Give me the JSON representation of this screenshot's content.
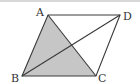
{
  "figure": {
    "type": "parallelogram",
    "vertices": {
      "A": {
        "label": "A",
        "x": 48,
        "y": 15
      },
      "B": {
        "label": "B",
        "x": 22,
        "y": 76
      },
      "C": {
        "label": "C",
        "x": 96,
        "y": 76
      },
      "D": {
        "label": "D",
        "x": 120,
        "y": 15
      }
    },
    "shaded_region": "triangle ABC",
    "diagonals": [
      "AC",
      "BD"
    ],
    "colors": {
      "stroke": "#3a3a3a",
      "shade": "#c6c6c6",
      "background": "#ffffff"
    }
  }
}
